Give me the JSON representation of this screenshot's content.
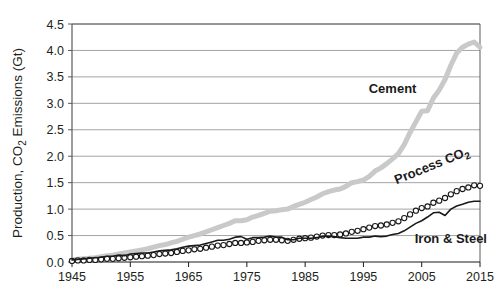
{
  "chart_data": {
    "type": "line",
    "title": "",
    "subtitle": "",
    "xlabel": "",
    "ylabel": "Production, CO2 Emissions (Gt)",
    "ylabel_parts": {
      "pre": "Production, CO",
      "sub": "2",
      "post": " Emissions (Gt)"
    },
    "xlim": [
      1945,
      2015
    ],
    "ylim": [
      0.0,
      4.5
    ],
    "xticks": [
      1945,
      1955,
      1965,
      1975,
      1985,
      1995,
      2005,
      2015
    ],
    "xticklabels": [
      "1945",
      "1955",
      "1965",
      "1975",
      "1985",
      "1995",
      "2005",
      "2015"
    ],
    "yticks": [
      0.0,
      0.5,
      1.0,
      1.5,
      2.0,
      2.5,
      3.0,
      3.5,
      4.0,
      4.5
    ],
    "yticklabels": [
      "0.0",
      "0.5",
      "1.0",
      "1.5",
      "2.0",
      "2.5",
      "3.0",
      "3.5",
      "4.0",
      "4.5"
    ],
    "grid": {
      "horizontal": true,
      "vertical": false,
      "color": "#9a9a9a"
    },
    "legend": {
      "position": "inline-annotations"
    },
    "x": [
      1945,
      1946,
      1947,
      1948,
      1949,
      1950,
      1951,
      1952,
      1953,
      1954,
      1955,
      1956,
      1957,
      1958,
      1959,
      1960,
      1961,
      1962,
      1963,
      1964,
      1965,
      1966,
      1967,
      1968,
      1969,
      1970,
      1971,
      1972,
      1973,
      1974,
      1975,
      1976,
      1977,
      1978,
      1979,
      1980,
      1981,
      1982,
      1983,
      1984,
      1985,
      1986,
      1987,
      1988,
      1989,
      1990,
      1991,
      1992,
      1993,
      1994,
      1995,
      1996,
      1997,
      1998,
      1999,
      2000,
      2001,
      2002,
      2003,
      2004,
      2005,
      2006,
      2007,
      2008,
      2009,
      2010,
      2011,
      2012,
      2013,
      2014,
      2015
    ],
    "series": [
      {
        "name": "Cement",
        "label": "Cement",
        "style": "thick-gray-line",
        "color": "#c9c9c9",
        "linewidth": 5,
        "marker": "none",
        "values": [
          0.04,
          0.05,
          0.06,
          0.07,
          0.08,
          0.1,
          0.12,
          0.13,
          0.15,
          0.17,
          0.19,
          0.21,
          0.23,
          0.25,
          0.28,
          0.31,
          0.33,
          0.36,
          0.39,
          0.43,
          0.47,
          0.5,
          0.53,
          0.57,
          0.61,
          0.65,
          0.69,
          0.73,
          0.78,
          0.78,
          0.8,
          0.85,
          0.88,
          0.92,
          0.96,
          0.97,
          0.99,
          1.0,
          1.05,
          1.09,
          1.13,
          1.18,
          1.23,
          1.29,
          1.33,
          1.36,
          1.38,
          1.43,
          1.5,
          1.52,
          1.55,
          1.62,
          1.72,
          1.78,
          1.86,
          1.95,
          2.05,
          2.22,
          2.45,
          2.65,
          2.85,
          2.86,
          3.1,
          3.25,
          3.45,
          3.72,
          3.95,
          4.06,
          4.12,
          4.16,
          4.06
        ]
      },
      {
        "name": "Process CO2",
        "label": "Process CO2",
        "style": "open-circle-markers",
        "color": "#1a1a1a",
        "linewidth": 1,
        "marker": "o",
        "values": [
          0.02,
          0.03,
          0.03,
          0.04,
          0.04,
          0.05,
          0.06,
          0.06,
          0.07,
          0.08,
          0.09,
          0.1,
          0.11,
          0.12,
          0.13,
          0.15,
          0.16,
          0.17,
          0.19,
          0.21,
          0.22,
          0.24,
          0.25,
          0.27,
          0.29,
          0.31,
          0.32,
          0.34,
          0.36,
          0.36,
          0.37,
          0.38,
          0.4,
          0.41,
          0.42,
          0.42,
          0.41,
          0.4,
          0.42,
          0.44,
          0.45,
          0.46,
          0.48,
          0.5,
          0.51,
          0.51,
          0.52,
          0.54,
          0.57,
          0.59,
          0.62,
          0.65,
          0.68,
          0.69,
          0.71,
          0.74,
          0.77,
          0.83,
          0.9,
          0.97,
          1.02,
          1.05,
          1.12,
          1.16,
          1.21,
          1.28,
          1.34,
          1.38,
          1.41,
          1.45,
          1.44
        ]
      },
      {
        "name": "Iron & Steel",
        "label": "Iron & Steel",
        "style": "thin-black-line",
        "color": "#1a1a1a",
        "linewidth": 1.6,
        "marker": "none",
        "values": [
          0.04,
          0.05,
          0.06,
          0.07,
          0.08,
          0.09,
          0.11,
          0.11,
          0.13,
          0.12,
          0.15,
          0.16,
          0.17,
          0.17,
          0.19,
          0.21,
          0.22,
          0.23,
          0.25,
          0.28,
          0.3,
          0.31,
          0.32,
          0.35,
          0.38,
          0.41,
          0.41,
          0.43,
          0.47,
          0.48,
          0.43,
          0.46,
          0.46,
          0.47,
          0.49,
          0.47,
          0.47,
          0.42,
          0.42,
          0.45,
          0.45,
          0.45,
          0.46,
          0.49,
          0.49,
          0.48,
          0.46,
          0.45,
          0.45,
          0.45,
          0.47,
          0.47,
          0.49,
          0.48,
          0.49,
          0.52,
          0.54,
          0.59,
          0.66,
          0.73,
          0.78,
          0.85,
          0.93,
          0.94,
          0.88,
          1.0,
          1.06,
          1.09,
          1.13,
          1.15,
          1.15
        ]
      }
    ],
    "annotations": [
      {
        "name": "cement-label",
        "text": "Cement",
        "x": 2000,
        "y": 3.2,
        "rotation": 0
      },
      {
        "name": "process-co2-label",
        "text": "Process CO2",
        "x": 2007,
        "y": 1.75,
        "rotation": -22
      },
      {
        "name": "iron-steel-label",
        "text": "Iron & Steel",
        "x": 2010,
        "y": 0.35,
        "rotation": 0
      }
    ]
  },
  "plot": {
    "background": "#ffffff",
    "frame_color": "#5a5a5a",
    "gridline_color": "#9a9a9a"
  }
}
